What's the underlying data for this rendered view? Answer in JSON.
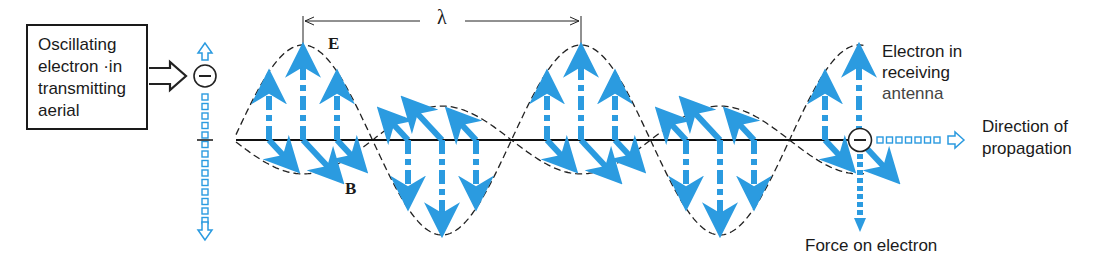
{
  "diagram": {
    "colors": {
      "field_arrow": "#2b9be0",
      "envelope": "#222222",
      "axis": "#111111",
      "text": "#1a1a1a"
    },
    "source_box": {
      "lines": [
        "Oscillating",
        "electron ·in",
        "transmitting",
        "aerial"
      ]
    },
    "labels": {
      "wavelength": "λ",
      "e_field": "E",
      "b_field": "B",
      "receiver_lines": [
        "Electron in",
        "receiving",
        "antenna"
      ],
      "direction_lines": [
        "Direction of",
        "propagation"
      ],
      "force": "Force on electron"
    },
    "electron_symbol": "−",
    "geometry": {
      "axis_y": 140,
      "axis_start_x": 236,
      "axis_end_x": 866,
      "wavelength_px": 278,
      "e_peak_x": [
        303,
        581,
        860
      ],
      "e_trough_x": [
        442,
        720
      ],
      "amplitude_px": 95
    }
  }
}
